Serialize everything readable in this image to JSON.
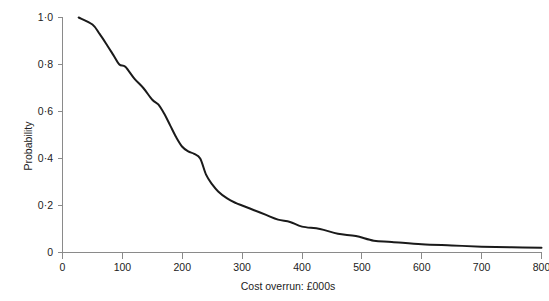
{
  "chart_data": {
    "type": "line",
    "title": "",
    "xlabel": "Cost overrun: £000s",
    "ylabel": "Probability",
    "xlim": [
      0,
      800
    ],
    "ylim": [
      0,
      1.0
    ],
    "grid": false,
    "legend": null,
    "xticks": [
      0,
      100,
      200,
      300,
      400,
      500,
      600,
      700,
      800
    ],
    "xtick_labels": [
      "0",
      "100",
      "200",
      "300",
      "400",
      "500",
      "600",
      "700",
      "800"
    ],
    "yticks": [
      0,
      0.2,
      0.4,
      0.6,
      0.8,
      1.0
    ],
    "ytick_labels": [
      "0",
      "0·2",
      "0·4",
      "0·6",
      "0·8",
      "1·0"
    ],
    "line_color": "#1a1a1a",
    "axis_color": "#8a8a8a",
    "series": [
      {
        "name": "Probability of cost overrun exceeding value",
        "x": [
          27,
          50,
          62,
          75,
          85,
          95,
          105,
          120,
          135,
          150,
          160,
          170,
          180,
          190,
          200,
          210,
          220,
          230,
          240,
          250,
          260,
          275,
          290,
          300,
          320,
          340,
          360,
          380,
          400,
          430,
          460,
          490,
          520,
          550,
          600,
          650,
          700,
          750,
          800
        ],
        "y": [
          1.0,
          0.97,
          0.93,
          0.88,
          0.84,
          0.8,
          0.79,
          0.74,
          0.7,
          0.65,
          0.63,
          0.59,
          0.54,
          0.49,
          0.45,
          0.43,
          0.42,
          0.4,
          0.33,
          0.29,
          0.26,
          0.23,
          0.21,
          0.2,
          0.18,
          0.16,
          0.14,
          0.13,
          0.11,
          0.1,
          0.08,
          0.07,
          0.05,
          0.045,
          0.035,
          0.03,
          0.025,
          0.022,
          0.02
        ]
      }
    ]
  },
  "axes": {
    "x_title": "Cost overrun: £000s",
    "y_title": "Probability"
  },
  "x_tick_labels": {
    "t0": "0",
    "t1": "100",
    "t2": "200",
    "t3": "300",
    "t4": "400",
    "t5": "500",
    "t6": "600",
    "t7": "700",
    "t8": "800"
  },
  "y_tick_labels": {
    "t0": "0",
    "t1": "0·2",
    "t2": "0·4",
    "t3": "0·6",
    "t4": "0·8",
    "t5": "1·0"
  }
}
